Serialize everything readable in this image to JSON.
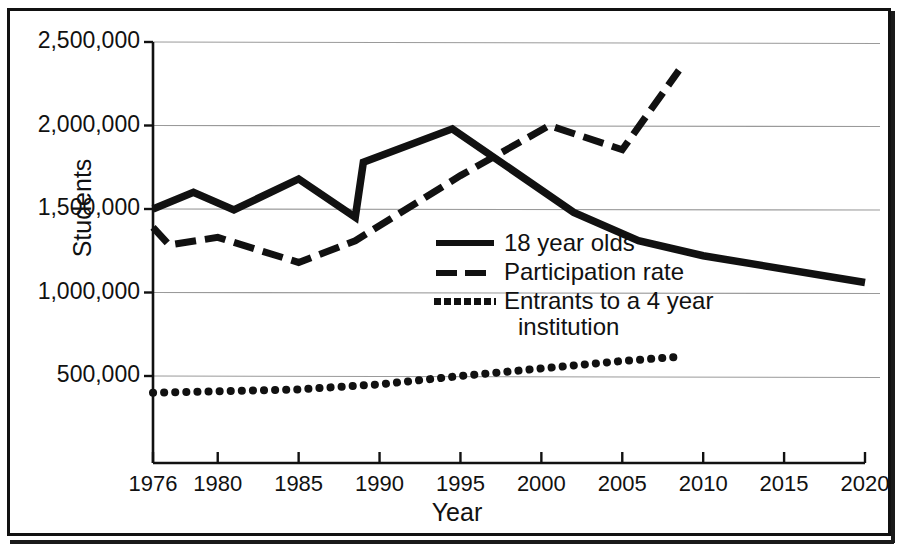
{
  "chart_data": {
    "type": "line",
    "title": "",
    "xlabel": "Year",
    "ylabel": "Students",
    "xlim": [
      1976,
      2020
    ],
    "ylim": [
      0,
      2500000
    ],
    "grid": true,
    "grid_axis": "y",
    "legend_position": "center",
    "xticks": [
      "1976",
      "1980",
      "1985",
      "1990",
      "1995",
      "2000",
      "2005",
      "2010",
      "2015",
      "2020"
    ],
    "xtick_values": [
      1976,
      1980,
      1985,
      1990,
      1995,
      2000,
      2005,
      2010,
      2015,
      2020
    ],
    "yticks": [
      "500,000",
      "1,000,000",
      "1,500,000",
      "2,000,000",
      "2,500,000"
    ],
    "ytick_values": [
      500000,
      1000000,
      1500000,
      2000000,
      2500000
    ],
    "series": [
      {
        "name": "18 year olds",
        "style": "solid",
        "color": "#111111",
        "x": [
          1976,
          1978.5,
          1981,
          1985,
          1988.5,
          1989,
          1994.5,
          2002,
          2006,
          2010,
          2020
        ],
        "values": [
          1500000,
          1600000,
          1495000,
          1680000,
          1450000,
          1780000,
          1980000,
          1480000,
          1310000,
          1220000,
          1060000
        ]
      },
      {
        "name": "Participation rate",
        "style": "dashed",
        "color": "#111111",
        "x": [
          1976,
          1977,
          1980,
          1985,
          1988.5,
          1995,
          2000.5,
          2005,
          2008.5
        ],
        "values": [
          1390000,
          1285000,
          1330000,
          1180000,
          1310000,
          1700000,
          2000000,
          1855000,
          2330000
        ]
      },
      {
        "name": "Entrants to a 4 year institution",
        "style": "dotted",
        "color": "#111111",
        "x": [
          1976,
          1985,
          1990,
          1995,
          2000,
          2005,
          2008.5
        ],
        "values": [
          400000,
          420000,
          450000,
          500000,
          545000,
          590000,
          615000
        ]
      }
    ]
  },
  "legend": {
    "items": [
      {
        "label": "18 year olds",
        "swatch": "solid-line-swatch",
        "label2": ""
      },
      {
        "label": "Participation rate",
        "swatch": "dashed-line-swatch",
        "label2": ""
      },
      {
        "label": "Entrants to a 4 year",
        "swatch": "dotted-line-swatch",
        "label2": "institution"
      }
    ]
  },
  "axes": {
    "x_title": "Year",
    "y_title": "Students"
  },
  "colors": {
    "ink": "#111111",
    "gridline": "#9a9a9a",
    "page": "#ffffff"
  }
}
